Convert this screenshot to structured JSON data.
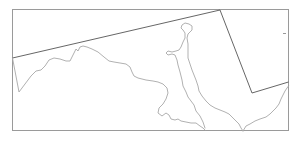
{
  "map": {
    "type": "outline-map",
    "frame": {
      "x": 12,
      "y": 9,
      "width": 277,
      "height": 122,
      "color": "#9a9a9a"
    },
    "boundary_color": "#555555",
    "coast_color": "#a8a8a8",
    "labels": []
  }
}
